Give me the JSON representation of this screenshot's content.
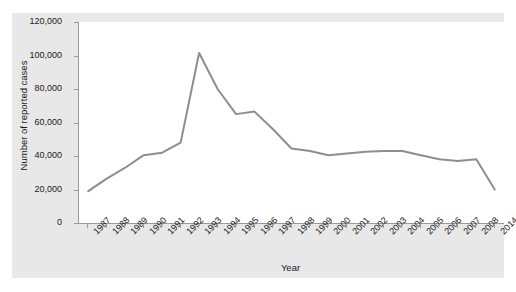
{
  "chart_data": {
    "type": "line",
    "title": "",
    "xlabel": "Year",
    "ylabel": "Number of reported cases",
    "categories": [
      "1987",
      "1988",
      "1989",
      "1990",
      "1991",
      "1992",
      "1993",
      "1994",
      "1995",
      "1996",
      "1997",
      "1998",
      "1999",
      "2000",
      "2001",
      "2002",
      "2003",
      "2004",
      "2005",
      "2006",
      "2007",
      "2008",
      "2014"
    ],
    "values": [
      19000,
      26500,
      33000,
      40500,
      42000,
      48000,
      101500,
      80000,
      65000,
      66500,
      56000,
      44500,
      43000,
      40500,
      41500,
      42500,
      43000,
      43000,
      40500,
      38000,
      37000,
      38000,
      20000
    ],
    "series": [
      {
        "name": "Number of reported cases",
        "values": [
          19000,
          26500,
          33000,
          40500,
          42000,
          48000,
          101500,
          80000,
          65000,
          66500,
          56000,
          44500,
          43000,
          40500,
          41500,
          42500,
          43000,
          43000,
          40500,
          38000,
          37000,
          38000,
          20000
        ]
      }
    ],
    "ylim": [
      0,
      120000
    ],
    "ytick_labels": [
      "0",
      "20,000",
      "40,000",
      "60,000",
      "80,000",
      "100,000",
      "120,000"
    ],
    "ytick_values": [
      0,
      20000,
      40000,
      60000,
      80000,
      100000,
      120000
    ],
    "grid": false,
    "legend": "none",
    "line_color": "#8e8e8e",
    "panel_color": "#e8e8e8",
    "plot_background": "#ffffff",
    "axis_color": "#9a9a9a"
  }
}
